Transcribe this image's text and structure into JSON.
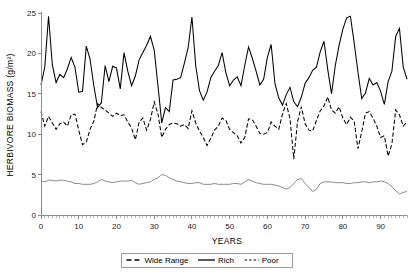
{
  "figure": {
    "truncated_caption_fragment": "",
    "background_color": "#ffffff"
  },
  "axes": {
    "y_title": "HERBIVORE BIOMASS (g/m²)",
    "x_title": "YEARS",
    "y_ticks": [
      "0",
      "5",
      "10",
      "15",
      "20",
      "25"
    ],
    "x_ticks": [
      "0",
      "10",
      "20",
      "30",
      "40",
      "50",
      "60",
      "70",
      "80",
      "90"
    ],
    "axis_color": "#8a8a8a"
  },
  "legend": {
    "items": [
      {
        "label": "Wide Range",
        "style": "long-dash",
        "color": "#000000"
      },
      {
        "label": "Rich",
        "style": "solid",
        "color": "#000000"
      },
      {
        "label": "Poor",
        "style": "short-dash",
        "color": "#000000"
      }
    ]
  },
  "chart_data": {
    "type": "line",
    "title": "",
    "xlabel": "YEARS",
    "ylabel": "HERBIVORE BIOMASS (g/m2)",
    "xlim": [
      0,
      97
    ],
    "ylim": [
      0,
      25
    ],
    "grid": false,
    "legend_position": "bottom-center",
    "x": [
      0,
      1,
      2,
      3,
      4,
      5,
      6,
      7,
      8,
      9,
      10,
      11,
      12,
      13,
      14,
      15,
      16,
      17,
      18,
      19,
      20,
      21,
      22,
      23,
      24,
      25,
      26,
      27,
      28,
      29,
      30,
      31,
      32,
      33,
      34,
      35,
      36,
      37,
      38,
      39,
      40,
      41,
      42,
      43,
      44,
      45,
      46,
      47,
      48,
      49,
      50,
      51,
      52,
      53,
      54,
      55,
      56,
      57,
      58,
      59,
      60,
      61,
      62,
      63,
      64,
      65,
      66,
      67,
      68,
      69,
      70,
      71,
      72,
      73,
      74,
      75,
      76,
      77,
      78,
      79,
      80,
      81,
      82,
      83,
      84,
      85,
      86,
      87,
      88,
      89,
      90,
      91,
      92,
      93,
      94,
      95,
      96,
      97
    ],
    "series": [
      {
        "name": "Rich",
        "style": "solid",
        "color": "#000000",
        "values": [
          16.1,
          18.3,
          24.6,
          18.6,
          16.4,
          17.4,
          17.0,
          18.1,
          19.5,
          18.3,
          15.2,
          15.3,
          20.9,
          19.3,
          16.0,
          13.3,
          13.9,
          18.5,
          16.5,
          18.4,
          18.2,
          15.6,
          20.1,
          17.8,
          16.0,
          17.2,
          19.2,
          20.1,
          21.0,
          22.1,
          20.4,
          16.0,
          11.4,
          13.3,
          12.8,
          16.7,
          16.8,
          17.0,
          18.8,
          20.7,
          24.5,
          18.5,
          15.4,
          14.2,
          15.2,
          17.0,
          17.8,
          18.5,
          20.1,
          17.6,
          16.0,
          16.7,
          17.1,
          16.0,
          18.5,
          20.8,
          19.4,
          17.8,
          16.1,
          16.8,
          19.5,
          21.1,
          16.3,
          14.5,
          13.6,
          14.9,
          15.8,
          14.0,
          13.4,
          14.6,
          16.3,
          17.0,
          17.9,
          18.3,
          20.2,
          21.5,
          18.0,
          15.0,
          18.5,
          21.0,
          23.0,
          24.4,
          24.6,
          21.3,
          17.7,
          14.4,
          15.1,
          16.9,
          16.1,
          16.4,
          15.3,
          13.7,
          16.5,
          17.8,
          22.1,
          23.1,
          18.3,
          16.8
        ]
      },
      {
        "name": "Wide Range",
        "style": "long-dash",
        "color": "#000000",
        "values": [
          12.8,
          11.0,
          12.2,
          11.4,
          10.6,
          11.3,
          11.5,
          11.0,
          12.4,
          12.5,
          10.5,
          8.7,
          9.0,
          10.6,
          11.6,
          13.8,
          13.3,
          13.0,
          12.6,
          12.2,
          12.6,
          12.3,
          12.4,
          11.5,
          10.8,
          9.3,
          11.5,
          12.0,
          10.5,
          11.8,
          14.0,
          12.5,
          9.6,
          10.6,
          11.2,
          11.4,
          11.3,
          11.0,
          11.2,
          10.7,
          12.9,
          11.4,
          10.4,
          9.6,
          8.6,
          9.5,
          10.5,
          11.0,
          12.0,
          11.7,
          10.6,
          10.2,
          9.8,
          8.9,
          9.6,
          11.9,
          11.8,
          11.0,
          10.1,
          10.0,
          10.2,
          11.5,
          11.0,
          10.6,
          12.5,
          13.8,
          11.9,
          6.9,
          11.6,
          13.4,
          11.3,
          10.5,
          10.4,
          11.7,
          12.9,
          13.5,
          14.6,
          13.0,
          12.6,
          13.4,
          12.0,
          11.2,
          12.1,
          11.6,
          8.2,
          10.3,
          12.6,
          12.8,
          12.0,
          11.0,
          9.6,
          9.8,
          7.3,
          8.8,
          13.0,
          12.4,
          11.0,
          11.5
        ]
      },
      {
        "name": "Poor",
        "style": "thin-solid",
        "color": "#4d4d4d",
        "values": [
          4.2,
          4.1,
          4.3,
          4.3,
          4.2,
          4.3,
          4.3,
          4.2,
          4.1,
          3.9,
          3.9,
          3.8,
          3.8,
          3.8,
          3.9,
          4.1,
          4.4,
          4.2,
          4.1,
          4.0,
          4.1,
          4.2,
          4.2,
          4.2,
          4.3,
          4.0,
          3.8,
          3.9,
          4.0,
          4.1,
          4.4,
          4.6,
          5.0,
          4.9,
          4.6,
          4.4,
          4.2,
          4.1,
          4.0,
          3.9,
          3.9,
          4.0,
          4.0,
          3.8,
          3.8,
          3.8,
          3.9,
          3.8,
          3.8,
          3.8,
          3.8,
          3.9,
          3.9,
          3.8,
          4.1,
          4.4,
          4.2,
          4.0,
          3.9,
          3.8,
          3.8,
          3.8,
          3.7,
          3.6,
          3.4,
          3.2,
          3.4,
          3.9,
          4.4,
          4.5,
          3.9,
          3.4,
          2.9,
          3.2,
          3.9,
          4.1,
          4.1,
          4.1,
          4.0,
          4.0,
          4.0,
          3.9,
          3.9,
          4.0,
          4.0,
          4.1,
          4.1,
          4.0,
          4.1,
          4.1,
          4.2,
          4.1,
          3.9,
          3.5,
          3.0,
          2.6,
          2.8,
          2.9
        ]
      }
    ]
  }
}
